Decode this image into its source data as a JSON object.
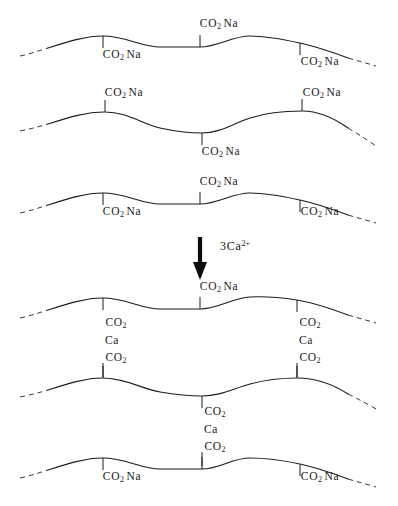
{
  "figure": {
    "background_color": "#ffffff",
    "ink_color": "#1a1a1a",
    "width": 398,
    "height": 506
  },
  "labels": {
    "carboxylate_sodium": "CO2Na",
    "carboxylate": "CO2",
    "calcium": "Ca",
    "reagent": "3 Ca2+"
  },
  "text_parts": {
    "co2na": {
      "c": "C",
      "o": "O",
      "sub": "2",
      "na": "Na"
    },
    "co2": {
      "c": "C",
      "o": "O",
      "sub": "2"
    },
    "ca": "Ca",
    "reagent": {
      "count": "3",
      "element": "Ca",
      "charge": "2+"
    }
  },
  "top_section": {
    "name": "before-crosslinking",
    "chains": [
      {
        "id": "chain-1",
        "groups": [
          {
            "position": "crest-left",
            "label": "CO2Na",
            "side": "below"
          },
          {
            "position": "trough-center",
            "label": "CO2Na",
            "side": "above"
          },
          {
            "position": "crest-right",
            "label": "CO2Na",
            "side": "below"
          }
        ]
      },
      {
        "id": "chain-2",
        "groups": [
          {
            "position": "crest-left",
            "label": "CO2Na",
            "side": "above"
          },
          {
            "position": "trough-center",
            "label": "CO2Na",
            "side": "below"
          },
          {
            "position": "crest-right",
            "label": "CO2Na",
            "side": "above"
          }
        ]
      },
      {
        "id": "chain-3",
        "groups": [
          {
            "position": "crest-left",
            "label": "CO2Na",
            "side": "below"
          },
          {
            "position": "trough-center",
            "label": "CO2Na",
            "side": "above"
          },
          {
            "position": "crest-right",
            "label": "CO2Na",
            "side": "below"
          }
        ]
      }
    ]
  },
  "reaction": {
    "arrow_direction": "down",
    "reagent_text": "3 Ca2+",
    "stoichiometry": 3,
    "ion": "Ca2+"
  },
  "bottom_section": {
    "name": "after-crosslinking",
    "chains": [
      {
        "id": "chain-4",
        "groups": [
          {
            "position": "crest-left",
            "label": "CO2",
            "side": "below",
            "role": "bridge-top"
          },
          {
            "position": "trough-center",
            "label": "CO2Na",
            "side": "above",
            "role": "free"
          },
          {
            "position": "crest-right",
            "label": "CO2",
            "side": "below",
            "role": "bridge-top"
          }
        ]
      },
      {
        "id": "chain-5",
        "groups": [
          {
            "position": "crest-left",
            "label": "CO2",
            "side": "above",
            "role": "bridge-bottom"
          },
          {
            "position": "trough-center",
            "label": "CO2",
            "side": "below",
            "role": "bridge-top"
          },
          {
            "position": "crest-right",
            "label": "CO2",
            "side": "above",
            "role": "bridge-bottom"
          }
        ]
      },
      {
        "id": "chain-6",
        "groups": [
          {
            "position": "crest-left",
            "label": "CO2Na",
            "side": "below",
            "role": "free"
          },
          {
            "position": "trough-center",
            "label": "CO2",
            "side": "above",
            "role": "bridge-bottom"
          },
          {
            "position": "crest-right",
            "label": "CO2Na",
            "side": "below",
            "role": "free"
          }
        ]
      }
    ],
    "bridges": [
      {
        "id": "bridge-left",
        "top_group": "CO2",
        "metal": "Ca",
        "bottom_group": "CO2",
        "between": [
          "chain-4",
          "chain-5"
        ]
      },
      {
        "id": "bridge-right",
        "top_group": "CO2",
        "metal": "Ca",
        "bottom_group": "CO2",
        "between": [
          "chain-4",
          "chain-5"
        ]
      },
      {
        "id": "bridge-center",
        "top_group": "CO2",
        "metal": "Ca",
        "bottom_group": "CO2",
        "between": [
          "chain-5",
          "chain-6"
        ]
      }
    ]
  }
}
